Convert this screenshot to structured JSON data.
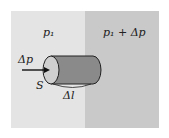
{
  "diagram": {
    "region_left": {
      "label": "p₁",
      "color": "#e4e4e4"
    },
    "region_right": {
      "label": "p₁ + Δp",
      "color": "#c9c9c9"
    },
    "cylinder": {
      "cross_section_label": "S",
      "length_label": "Δl",
      "body_color": "#8a8a8a",
      "face_color": "#cfcfcf"
    },
    "force_arrow": {
      "label": "Δp",
      "direction": "right"
    }
  }
}
